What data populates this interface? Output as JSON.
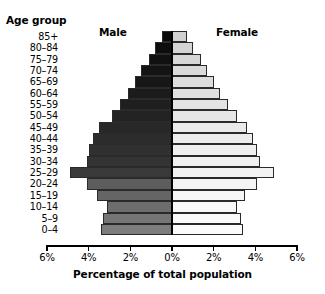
{
  "chart": {
    "type": "bar",
    "title": "",
    "y_axis_title": "Age group",
    "x_axis_title": "Percentage of total population",
    "series_labels": {
      "male": "Male",
      "female": "Female"
    },
    "x_tick_labels": [
      "6%",
      "4%",
      "2%",
      "0%",
      "2%",
      "4%",
      "6%"
    ]
  },
  "chart_data": {
    "type": "bar",
    "title": "",
    "subtitle": "",
    "xlabel": "Percentage of total population",
    "ylabel": "Age group",
    "orientation": "horizontal-diverging",
    "layout": "population-pyramid",
    "grid": false,
    "legend_position": "inside-top",
    "xlim": [
      -6,
      6
    ],
    "xticks": [
      -6,
      -4,
      -2,
      0,
      2,
      4,
      6
    ],
    "xticklabels": [
      "6%",
      "4%",
      "2%",
      "0%",
      "2%",
      "4%",
      "6%"
    ],
    "categories": [
      "0–4",
      "5–9",
      "10–14",
      "15–19",
      "20–24",
      "25–29",
      "30–34",
      "35–39",
      "40–44",
      "45–49",
      "50–54",
      "55–59",
      "60–64",
      "65–69",
      "70–74",
      "75–79",
      "80–84",
      "85+"
    ],
    "series": [
      {
        "name": "Male",
        "side": "left",
        "values": [
          3.4,
          3.3,
          3.1,
          3.6,
          4.1,
          4.9,
          4.1,
          4.0,
          3.8,
          3.5,
          2.9,
          2.5,
          2.1,
          1.8,
          1.5,
          1.1,
          0.8,
          0.5
        ],
        "colors": [
          "#7d7d7d",
          "#757575",
          "#6d6d6d",
          "#656565",
          "#5d5d5d",
          "#3a3a3a",
          "#343434",
          "#303030",
          "#2c2c2c",
          "#282828",
          "#232323",
          "#1f1f1f",
          "#1b1b1b",
          "#171717",
          "#141414",
          "#111111",
          "#0d0d0d",
          "#090909"
        ]
      },
      {
        "name": "Female",
        "side": "right",
        "values": [
          3.4,
          3.3,
          3.1,
          3.5,
          4.1,
          4.9,
          4.2,
          4.1,
          3.9,
          3.6,
          3.1,
          2.7,
          2.3,
          2.0,
          1.7,
          1.4,
          1.0,
          0.7
        ],
        "colors": [
          "#fbfbfb",
          "#fafafa",
          "#f8f8f8",
          "#f6f6f6",
          "#f4f4f4",
          "#f2f2f2",
          "#f0f0f0",
          "#eeeeee",
          "#ececec",
          "#eaeaea",
          "#e6e6e6",
          "#e3e3e3",
          "#e0e0e0",
          "#dddddd",
          "#dadada",
          "#d7d7d7",
          "#d4d4d4",
          "#d1d1d1"
        ]
      }
    ]
  }
}
